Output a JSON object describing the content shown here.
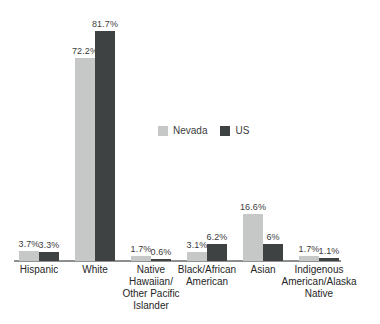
{
  "chart_data": {
    "type": "bar",
    "title": "",
    "xlabel": "",
    "ylabel": "",
    "unit": "%",
    "grid": false,
    "legend_position": "center-right",
    "ylim": [
      0,
      90
    ],
    "axis_line_color": "#8e9090",
    "text_color": "#3c3c3c",
    "categories": [
      "Hispanic",
      "White",
      "Native Hawaiian/ Other Pacific Islander",
      "Black/African American",
      "Asian",
      "Indigenous American/Alaska Native"
    ],
    "category_label_lines": [
      [
        "Hispanic"
      ],
      [
        "White"
      ],
      [
        "Native",
        "Hawaiian/",
        "Other Pacific",
        "Islander"
      ],
      [
        "Black/African",
        "American"
      ],
      [
        "Asian"
      ],
      [
        "Indigenous",
        "American/Alaska",
        "Native"
      ]
    ],
    "series": [
      {
        "name": "Nevada",
        "color": "#c6c7c7",
        "values": [
          3.7,
          72.2,
          1.7,
          3.1,
          16.6,
          1.7
        ],
        "labels": [
          "3.7%",
          "72.2%",
          "1.7%",
          "3.1%",
          "16.6%",
          "1.7%"
        ]
      },
      {
        "name": "US",
        "color": "#3e4243",
        "values": [
          3.3,
          81.7,
          0.6,
          6.2,
          6,
          1.1
        ],
        "labels": [
          "3.3%",
          "81.7%",
          "0.6%",
          "6.2%",
          "6%",
          "1.1%"
        ]
      }
    ]
  }
}
